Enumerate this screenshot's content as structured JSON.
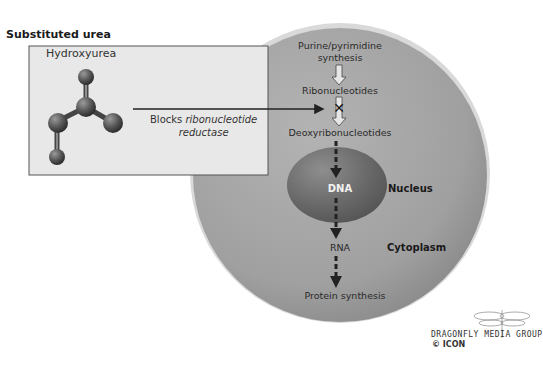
{
  "diagram": {
    "box": {
      "title": "Substituted urea",
      "drug_name": "Hydroxyurea",
      "action_prefix": "Blocks ",
      "action_italic_1": "ribonucleotide",
      "action_italic_2": "reductase"
    },
    "pathway": {
      "step1": "Purine/pyrimidine",
      "step1b": "synthesis",
      "step2": "Ribonucleotides",
      "step3": "Deoxyribonucleotides",
      "step4": "DNA",
      "step5": "RNA",
      "step6": "Protein synthesis"
    },
    "compartments": {
      "nucleus": "Nucleus",
      "cytoplasm": "Cytoplasm"
    },
    "block_marker": "✕",
    "colors": {
      "cell": "#a3a3a3",
      "cell_rim": "#d8d8d8",
      "nucleus": "#6e6e6e",
      "box_fill": "#e6e6e6",
      "arrow": "#222222"
    }
  },
  "credit": {
    "logo_text": "DRAGONFLY MEDIA GROUP",
    "sub_logo": "© ICON"
  }
}
